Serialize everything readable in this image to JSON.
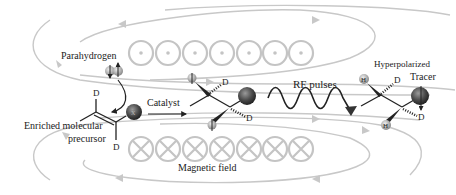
{
  "diagram": {
    "labels": {
      "parahydrogen": "Parahydrogen",
      "enriched_line1": "Enriched molecular",
      "enriched_line2": "precursor",
      "catalyst": "Catalyst",
      "rf_pulses": "RF pulses",
      "hyperpolarized": "Hyperpolarized",
      "tracer": "Tracer",
      "magnetic_field": "Magnetic field"
    },
    "atoms": {
      "deuterium": "D",
      "hydrogen": "H",
      "substituent": "X"
    },
    "field_symbols": {
      "top_row": "out-of-page (dot)",
      "top_count": 7,
      "bottom_row": "into-page (cross)",
      "bottom_count": 7
    },
    "colors": {
      "field_lines": "#c8c8c8",
      "text": "#222222",
      "substituent_sphere": "#555555",
      "hydrogen_sphere": "#aaaaaa"
    }
  }
}
